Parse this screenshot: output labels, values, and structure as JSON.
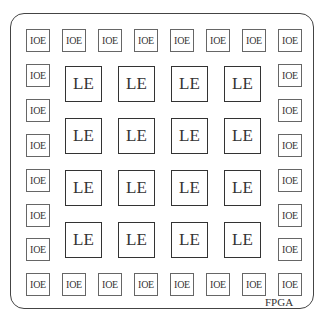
{
  "diagram": {
    "title_label": "FPGA",
    "ioe_label": "IOE",
    "le_label": "LE",
    "ioe": [
      {
        "x": 26,
        "y": 29
      },
      {
        "x": 62,
        "y": 29
      },
      {
        "x": 98,
        "y": 29
      },
      {
        "x": 134,
        "y": 29
      },
      {
        "x": 170,
        "y": 29
      },
      {
        "x": 206,
        "y": 29
      },
      {
        "x": 242,
        "y": 29
      },
      {
        "x": 278,
        "y": 29
      },
      {
        "x": 26,
        "y": 64
      },
      {
        "x": 26,
        "y": 99
      },
      {
        "x": 26,
        "y": 134
      },
      {
        "x": 26,
        "y": 169
      },
      {
        "x": 26,
        "y": 204
      },
      {
        "x": 26,
        "y": 238
      },
      {
        "x": 278,
        "y": 64
      },
      {
        "x": 278,
        "y": 99
      },
      {
        "x": 278,
        "y": 134
      },
      {
        "x": 278,
        "y": 169
      },
      {
        "x": 278,
        "y": 204
      },
      {
        "x": 278,
        "y": 238
      },
      {
        "x": 26,
        "y": 273
      },
      {
        "x": 62,
        "y": 273
      },
      {
        "x": 98,
        "y": 273
      },
      {
        "x": 134,
        "y": 273
      },
      {
        "x": 170,
        "y": 273
      },
      {
        "x": 206,
        "y": 273
      },
      {
        "x": 242,
        "y": 273
      },
      {
        "x": 278,
        "y": 273
      }
    ],
    "le": [
      {
        "x": 65,
        "y": 66
      },
      {
        "x": 118,
        "y": 66
      },
      {
        "x": 171,
        "y": 66
      },
      {
        "x": 224,
        "y": 66
      },
      {
        "x": 65,
        "y": 118
      },
      {
        "x": 118,
        "y": 118
      },
      {
        "x": 171,
        "y": 118
      },
      {
        "x": 224,
        "y": 118
      },
      {
        "x": 65,
        "y": 170
      },
      {
        "x": 118,
        "y": 170
      },
      {
        "x": 171,
        "y": 170
      },
      {
        "x": 224,
        "y": 170
      },
      {
        "x": 65,
        "y": 222
      },
      {
        "x": 118,
        "y": 222
      },
      {
        "x": 171,
        "y": 222
      },
      {
        "x": 224,
        "y": 222
      }
    ]
  }
}
